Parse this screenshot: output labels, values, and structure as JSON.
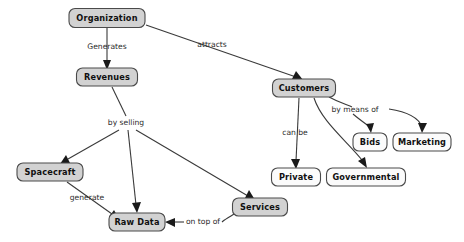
{
  "diagram": {
    "type": "concept-map",
    "background_color": "#ffffff",
    "node_fill_gray": "#d2d2d2",
    "node_fill_white": "#fbfbfb",
    "node_border_color": "#4a4a4a",
    "edge_color": "#3a3a3a",
    "nodes": [
      {
        "id": "organization",
        "label": "Organization",
        "fill": "gray",
        "x": 107,
        "y": 18,
        "w": 76,
        "h": 19
      },
      {
        "id": "revenues",
        "label": "Revenues",
        "fill": "gray",
        "x": 107,
        "y": 77,
        "w": 61,
        "h": 18
      },
      {
        "id": "customers",
        "label": "Customers",
        "fill": "gray",
        "x": 304,
        "y": 88,
        "w": 63,
        "h": 18
      },
      {
        "id": "bids",
        "label": "Bids",
        "fill": "white",
        "x": 370,
        "y": 142,
        "w": 34,
        "h": 18
      },
      {
        "id": "marketing",
        "label": "Marketing",
        "fill": "white",
        "x": 422,
        "y": 142,
        "w": 58,
        "h": 18
      },
      {
        "id": "private",
        "label": "Private",
        "fill": "white",
        "x": 296,
        "y": 177,
        "w": 49,
        "h": 18
      },
      {
        "id": "governmental",
        "label": "Governmental",
        "fill": "white",
        "x": 366,
        "y": 177,
        "w": 79,
        "h": 18
      },
      {
        "id": "spacecraft",
        "label": "Spacecraft",
        "fill": "gray",
        "x": 50,
        "y": 172,
        "w": 66,
        "h": 18
      },
      {
        "id": "services",
        "label": "Services",
        "fill": "gray",
        "x": 260,
        "y": 207,
        "w": 55,
        "h": 18
      },
      {
        "id": "rawdata",
        "label": "Raw Data",
        "fill": "gray",
        "x": 137,
        "y": 222,
        "w": 56,
        "h": 18
      }
    ],
    "edges": [
      {
        "id": "organization-revenues",
        "from": "organization",
        "to": "revenues",
        "label": "Generates"
      },
      {
        "id": "organization-customers",
        "from": "organization",
        "to": "customers",
        "label": "attracts"
      },
      {
        "id": "revenues-spacecraft",
        "from": "revenues",
        "to": "spacecraft",
        "label": "by selling"
      },
      {
        "id": "revenues-rawdata",
        "from": "revenues",
        "to": "rawdata",
        "label": ""
      },
      {
        "id": "revenues-services",
        "from": "revenues",
        "to": "services",
        "label": ""
      },
      {
        "id": "customers-private",
        "from": "customers",
        "to": "private",
        "label": "can be"
      },
      {
        "id": "customers-governmental",
        "from": "customers",
        "to": "governmental",
        "label": ""
      },
      {
        "id": "customers-bids",
        "from": "customers",
        "to": "bids",
        "label": "by means of"
      },
      {
        "id": "customers-marketing",
        "from": "customers",
        "to": "marketing",
        "label": ""
      },
      {
        "id": "spacecraft-rawdata",
        "from": "spacecraft",
        "to": "rawdata",
        "label": "generate"
      },
      {
        "id": "services-rawdata",
        "from": "services",
        "to": "rawdata",
        "label": "on top of"
      }
    ],
    "edge_labels": [
      {
        "id": "label-generates",
        "text": "Generates",
        "x": 107,
        "y": 47
      },
      {
        "id": "label-attracts",
        "text": "attracts",
        "x": 212,
        "y": 45
      },
      {
        "id": "label-by-selling",
        "text": "by selling",
        "x": 126,
        "y": 123
      },
      {
        "id": "label-by-means-of",
        "text": "by means of",
        "x": 355,
        "y": 110
      },
      {
        "id": "label-can-be",
        "text": "can be",
        "x": 295,
        "y": 133
      },
      {
        "id": "label-generate",
        "text": "generate",
        "x": 87,
        "y": 198
      },
      {
        "id": "label-on-top-of",
        "text": "on top of",
        "x": 203,
        "y": 222
      }
    ]
  }
}
